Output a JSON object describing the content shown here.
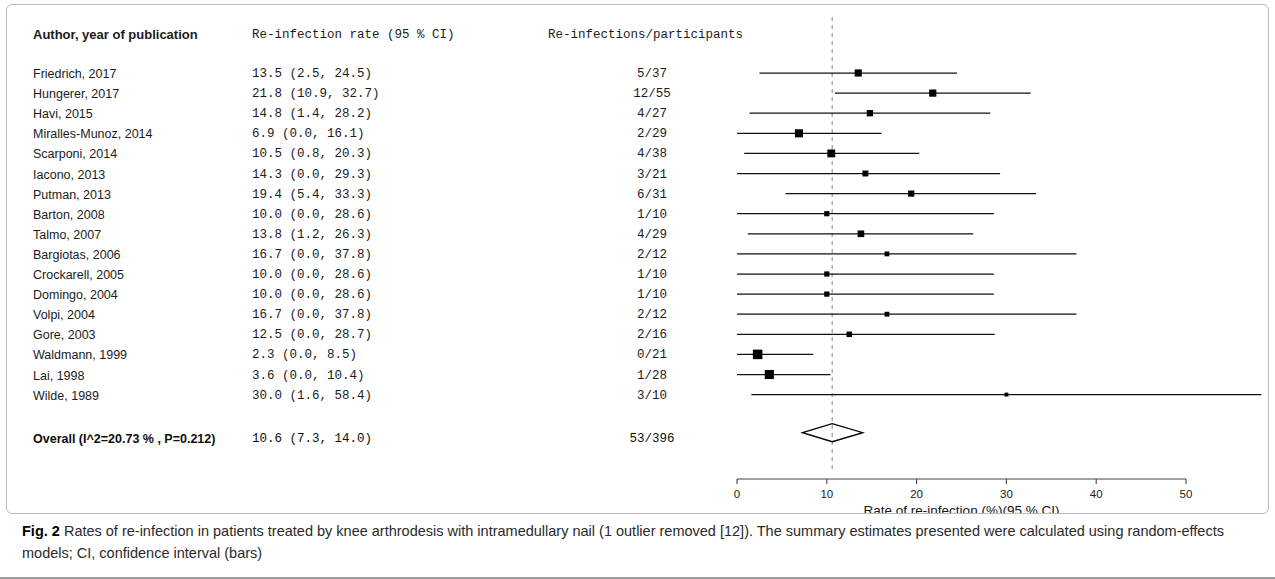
{
  "figure": {
    "caption_label": "Fig. 2",
    "caption_text": " Rates of re-infection in patients treated by knee arthrodesis with intramedullary nail (1 outlier removed [12]). The summary estimates presented were calculated using random-effects models; CI, confidence interval (bars)"
  },
  "table": {
    "headers": {
      "author": "Author, year of publication",
      "rate": "Re-infection rate (95 % CI)",
      "events": "Re-infections/participants"
    }
  },
  "overall": {
    "author": "Overall (I^2=20.73 % , P=0.212)",
    "rate": "10.6 (7.3, 14.0)",
    "events": "53/396"
  },
  "chart_data": {
    "type": "forest",
    "title": "",
    "xlabel": "Rate of re-infection (%)(95 % CI)",
    "ylabel": "",
    "xlim": [
      0,
      50
    ],
    "xticks": [
      0,
      10,
      20,
      30,
      40,
      50
    ],
    "xticklabels": [
      "0",
      "10",
      "20",
      "30",
      "40",
      "50"
    ],
    "grid": false,
    "reference_line": 10.6,
    "reference_line_style": "dashed",
    "effect_measure": "Re-infection rate (%)",
    "marker_shape": "square",
    "summary_shape": "diamond",
    "studies": [
      {
        "label": "Friedrich, 2017",
        "rate": "13.5 (2.5, 24.5)",
        "events": "5/37",
        "estimate": 13.5,
        "ci_low": 2.5,
        "ci_high": 24.5,
        "weight": 6.3
      },
      {
        "label": "Hungerer, 2017",
        "rate": "21.8 (10.9, 32.7)",
        "events": "12/55",
        "estimate": 21.8,
        "ci_low": 10.9,
        "ci_high": 32.7,
        "weight": 6.4
      },
      {
        "label": "Havi, 2015",
        "rate": "14.8 (1.4, 28.2)",
        "events": "4/27",
        "estimate": 14.8,
        "ci_low": 1.4,
        "ci_high": 28.2,
        "weight": 5.2
      },
      {
        "label": "Miralles-Munoz, 2014",
        "rate": "6.9 (0.0, 16.1)",
        "events": "2/29",
        "estimate": 6.9,
        "ci_low": 0.0,
        "ci_high": 16.1,
        "weight": 7.6
      },
      {
        "label": "Scarponi, 2014",
        "rate": "10.5 (0.8, 20.3)",
        "events": "4/38",
        "estimate": 10.5,
        "ci_low": 0.8,
        "ci_high": 20.3,
        "weight": 7.3
      },
      {
        "label": "Iacono, 2013",
        "rate": "14.3 (0.0, 29.3)",
        "events": "3/21",
        "estimate": 14.3,
        "ci_low": 0.0,
        "ci_high": 29.3,
        "weight": 4.6
      },
      {
        "label": "Putman, 2013",
        "rate": "19.4 (5.4, 33.3)",
        "events": "6/31",
        "estimate": 19.4,
        "ci_low": 5.4,
        "ci_high": 33.3,
        "weight": 5.0
      },
      {
        "label": "Barton, 2008",
        "rate": "10.0 (0.0, 28.6)",
        "events": "1/10",
        "estimate": 10.0,
        "ci_low": 0.0,
        "ci_high": 28.6,
        "weight": 3.6
      },
      {
        "label": "Talmo, 2007",
        "rate": "13.8 (1.2, 26.3)",
        "events": "4/29",
        "estimate": 13.8,
        "ci_low": 1.2,
        "ci_high": 26.3,
        "weight": 5.6
      },
      {
        "label": "Bargiotas, 2006",
        "rate": "16.7 (0.0, 37.8)",
        "events": "2/12",
        "estimate": 16.7,
        "ci_low": 0.0,
        "ci_high": 37.8,
        "weight": 3.1
      },
      {
        "label": "Crockarell, 2005",
        "rate": "10.0 (0.0, 28.6)",
        "events": "1/10",
        "estimate": 10.0,
        "ci_low": 0.0,
        "ci_high": 28.6,
        "weight": 3.6
      },
      {
        "label": "Domingo, 2004",
        "rate": "10.0 (0.0, 28.6)",
        "events": "1/10",
        "estimate": 10.0,
        "ci_low": 0.0,
        "ci_high": 28.6,
        "weight": 3.6
      },
      {
        "label": "Volpi, 2004",
        "rate": "16.7 (0.0, 37.8)",
        "events": "2/12",
        "estimate": 16.7,
        "ci_low": 0.0,
        "ci_high": 37.8,
        "weight": 3.1
      },
      {
        "label": "Gore, 2003",
        "rate": "12.5 (0.0, 28.7)",
        "events": "2/16",
        "estimate": 12.5,
        "ci_low": 0.0,
        "ci_high": 28.7,
        "weight": 4.0
      },
      {
        "label": "Waldmann, 1999",
        "rate": "2.3 (0.0, 8.5)",
        "events": "0/21",
        "estimate": 2.3,
        "ci_low": 0.0,
        "ci_high": 8.5,
        "weight": 9.6
      },
      {
        "label": "Lai, 1998",
        "rate": "3.6 (0.0, 10.4)",
        "events": "1/28",
        "estimate": 3.6,
        "ci_low": 0.0,
        "ci_high": 10.4,
        "weight": 9.0
      },
      {
        "label": "Wilde, 1989",
        "rate": "30.0 (1.6, 58.4)",
        "events": "3/10",
        "estimate": 30.0,
        "ci_low": 1.6,
        "ci_high": 58.4,
        "weight": 1.8
      }
    ],
    "summary": {
      "label": "Overall (I^2=20.73 % , P=0.212)",
      "rate": "10.6 (7.3, 14.0)",
      "events": "53/396",
      "estimate": 10.6,
      "ci_low": 7.3,
      "ci_high": 14.0,
      "i_squared": 20.73,
      "p_value": 0.212,
      "total_events": 53,
      "total_participants": 396,
      "model": "random-effects"
    }
  }
}
